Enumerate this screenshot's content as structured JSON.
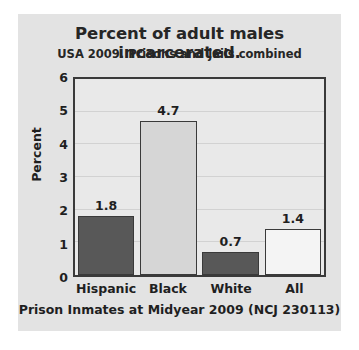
{
  "chart_data": {
    "type": "bar",
    "title": "Percent of adult males incarcerated.",
    "subtitle": "USA 2009. Prisons and jails combined",
    "xlabel": "Prison Inmates at Midyear 2009 (NCJ 230113)",
    "ylabel": "Percent",
    "categories": [
      "Hispanic",
      "Black",
      "White",
      "All"
    ],
    "values": [
      1.8,
      4.7,
      0.7,
      1.4
    ],
    "value_labels": [
      "1.8",
      "4.7",
      "0.7",
      "1.4"
    ],
    "bar_colors": [
      "#585858",
      "#d6d6d6",
      "#585858",
      "#f4f4f4"
    ],
    "ylim": [
      0,
      6
    ],
    "yticks": [
      0,
      1,
      2,
      3,
      4,
      5,
      6
    ],
    "ytick_labels": [
      "0",
      "1",
      "2",
      "3",
      "4",
      "5",
      "6"
    ],
    "grid": true,
    "legend": false,
    "plot_background": "#e9e9e9",
    "card_background": "#e3e3e3",
    "axis_color": "#3a3a3a"
  }
}
